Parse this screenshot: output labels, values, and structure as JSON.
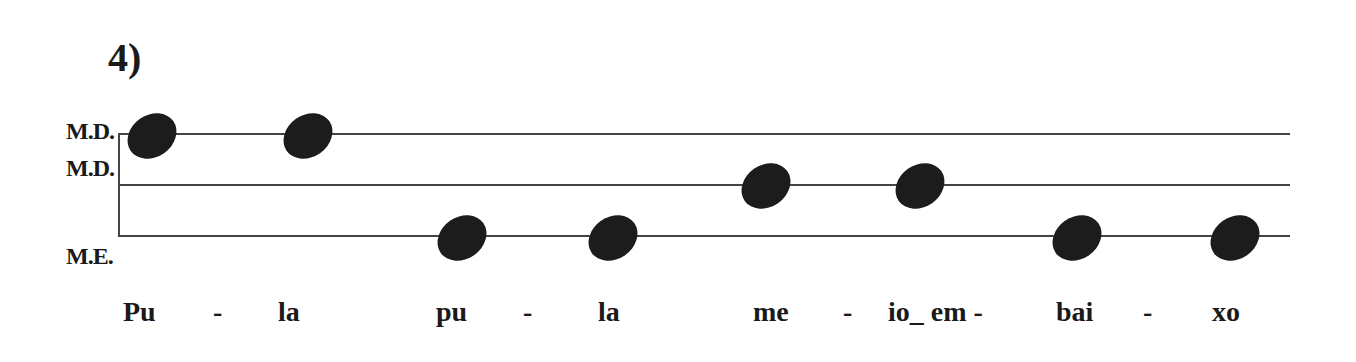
{
  "title": "4)",
  "staff": {
    "labels": [
      "M.D.",
      "M.D.",
      "M.E."
    ],
    "lines_y": [
      134,
      185,
      236
    ]
  },
  "notes": [
    {
      "x": 152,
      "y": 136,
      "line": 0
    },
    {
      "x": 308,
      "y": 136,
      "line": 0
    },
    {
      "x": 462,
      "y": 238,
      "line": 2
    },
    {
      "x": 613,
      "y": 238,
      "line": 2
    },
    {
      "x": 766,
      "y": 186,
      "line": 1
    },
    {
      "x": 920,
      "y": 186,
      "line": 1
    },
    {
      "x": 1077,
      "y": 238,
      "line": 2
    },
    {
      "x": 1235,
      "y": 238,
      "line": 2
    }
  ],
  "lyrics": [
    {
      "text": "Pu",
      "x": 123
    },
    {
      "text": "-",
      "x": 213
    },
    {
      "text": "la",
      "x": 278
    },
    {
      "text": "pu",
      "x": 436
    },
    {
      "text": "-",
      "x": 523
    },
    {
      "text": "la",
      "x": 598
    },
    {
      "text": "me",
      "x": 753
    },
    {
      "text": "-",
      "x": 843
    },
    {
      "text": "io_ em -",
      "x": 888
    },
    {
      "text": "bai",
      "x": 1056
    },
    {
      "text": "-",
      "x": 1143
    },
    {
      "text": "xo",
      "x": 1212
    }
  ]
}
